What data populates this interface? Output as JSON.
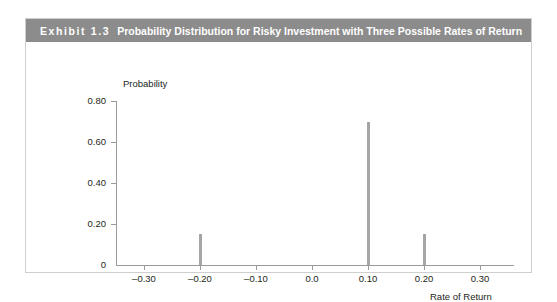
{
  "exhibit": {
    "number_label": "Exhibit 1.3",
    "number_prefix": "Exhibit",
    "number_value": "1.3",
    "title": "Probability Distribution for Risky Investment with Three Possible Rates of Return",
    "header_background": "#8c8c8c",
    "header_text_color": "#ffffff",
    "panel_border_color": "#cfcfcf"
  },
  "chart_data": {
    "type": "bar",
    "title": "Probability Distribution for Risky Investment with Three Possible Rates of Return",
    "xlabel": "Rate of Return",
    "ylabel": "Probability",
    "categories": [
      "-0.20",
      "0.10",
      "0.20"
    ],
    "x": [
      -0.2,
      0.1,
      0.2
    ],
    "values": [
      0.15,
      0.7,
      0.15
    ],
    "xlim": [
      -0.35,
      0.33
    ],
    "ylim": [
      0,
      0.88
    ],
    "xticks": [
      -0.3,
      -0.2,
      -0.1,
      0.0,
      0.1,
      0.2,
      0.3
    ],
    "xticklabels": [
      "–0.30",
      "–0.20",
      "–0.10",
      "0.0",
      "0.10",
      "0.20",
      "0.30"
    ],
    "yticks": [
      0,
      0.2,
      0.4,
      0.6,
      0.8
    ],
    "yticklabels": [
      "0",
      "0.20",
      "0.40",
      "0.60",
      "0.80"
    ],
    "grid": false,
    "legend": "none",
    "bar_color": "#a6a6a6",
    "axis_color": "#9a9a9a"
  }
}
